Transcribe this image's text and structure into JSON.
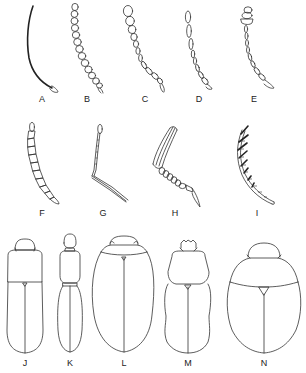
{
  "figure": {
    "row1_antennae": [
      {
        "label": "A",
        "form": "filiform-slender, curved, dark"
      },
      {
        "label": "B",
        "form": "moniliform (bead-like)"
      },
      {
        "label": "C",
        "form": "gradually clavate / thickening"
      },
      {
        "label": "D",
        "form": "filiform with elongate apical segment"
      },
      {
        "label": "E",
        "form": "capitate (abrupt club)"
      }
    ],
    "row2_antennae": [
      {
        "label": "F",
        "form": "serrate"
      },
      {
        "label": "G",
        "form": "geniculate (elbowed)"
      },
      {
        "label": "H",
        "form": "lamellate"
      },
      {
        "label": "I",
        "form": "pectinate"
      }
    ],
    "row3_bodies": [
      {
        "label": "J",
        "form": "elongate parallel-sided"
      },
      {
        "label": "K",
        "form": "narrow, constricted (ant-like)"
      },
      {
        "label": "L",
        "form": "elongate-oval"
      },
      {
        "label": "M",
        "form": "oblong with lobed head"
      },
      {
        "label": "N",
        "form": "broadly oval / rounded"
      }
    ]
  },
  "labels": {
    "A": "A",
    "B": "B",
    "C": "C",
    "D": "D",
    "E": "E",
    "F": "F",
    "G": "G",
    "H": "H",
    "I": "I",
    "J": "J",
    "K": "K",
    "L": "L",
    "M": "M",
    "N": "N"
  },
  "colors": {
    "background": "#ffffff",
    "stroke": "#333333"
  }
}
